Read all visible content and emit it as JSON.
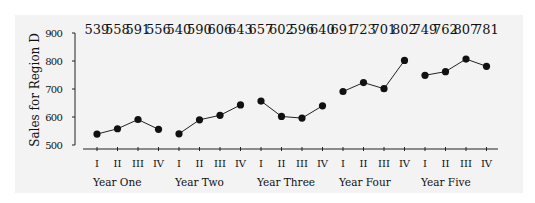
{
  "chart_data": {
    "type": "line",
    "title": "",
    "xlabel": "",
    "ylabel": "Sales for Region D",
    "ylim": [
      500,
      900
    ],
    "yticks": [
      500,
      600,
      700,
      800,
      900
    ],
    "grid": false,
    "legend": null,
    "groups": [
      "Year One",
      "Year Two",
      "Year Three",
      "Year Four",
      "Year Five"
    ],
    "quarters": [
      "I",
      "II",
      "III",
      "IV"
    ],
    "series": [
      {
        "name": "Year One",
        "values": [
          539,
          558,
          591,
          556
        ]
      },
      {
        "name": "Year Two",
        "values": [
          540,
          590,
          606,
          643
        ]
      },
      {
        "name": "Year Three",
        "values": [
          657,
          602,
          596,
          640
        ]
      },
      {
        "name": "Year Four",
        "values": [
          691,
          723,
          701,
          802
        ]
      },
      {
        "name": "Year Five",
        "values": [
          749,
          762,
          807,
          781
        ]
      }
    ],
    "annotations": "Data values printed above each quarter along the top of the chart"
  },
  "colors": {
    "background": "#ffffff",
    "panel": "#f3f3f3",
    "line": "#222222",
    "marker": "#111111"
  }
}
